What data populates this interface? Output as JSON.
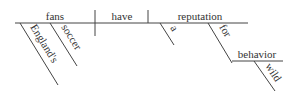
{
  "diagram": {
    "type": "Reed-Kellogg sentence diagram",
    "sentence_words": {
      "subject": "fans",
      "verb": "have",
      "object": "reputation",
      "subject_modifiers": [
        "England's",
        "soccer"
      ],
      "object_modifiers": [
        "a"
      ],
      "preposition": "for",
      "prep_object": "behavior",
      "prep_object_modifier": "wild"
    },
    "colors": {
      "line": "#444444",
      "text": "#333333"
    }
  }
}
